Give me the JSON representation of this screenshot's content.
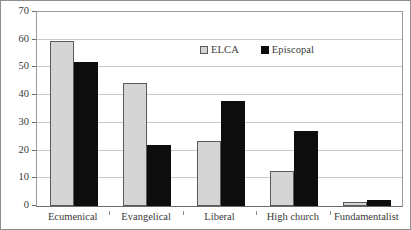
{
  "chart_data": {
    "type": "bar",
    "title": "",
    "subtitle": "",
    "xlabel": "",
    "ylabel": "",
    "categories": [
      "Ecumenical",
      "Evangelical",
      "Liberal",
      "High church",
      "Fundamentalist"
    ],
    "series": [
      {
        "name": "ELCA",
        "color": "#d5d5d5",
        "values": [
          59.5,
          44.5,
          23.5,
          12.5,
          1.5
        ]
      },
      {
        "name": "Episcopal",
        "color": "#0d0d0d",
        "values": [
          52,
          22,
          38,
          27,
          2
        ]
      }
    ],
    "ylim": [
      0,
      70
    ],
    "ytick_step": 10,
    "yticks": [
      0,
      10,
      20,
      30,
      40,
      50,
      60,
      70
    ],
    "ytick_labels": [
      "0",
      "10",
      "20",
      "30",
      "40",
      "50",
      "60",
      "70"
    ],
    "grid": "horizontal",
    "grid_color": "#c9c9c9",
    "legend_position": "inside-upper-center",
    "legend_border": false,
    "plot_border": true,
    "frame_border": true
  },
  "legend": {
    "entries": [
      {
        "label": "ELCA",
        "swatch": "legend-swatch-elca"
      },
      {
        "label": "Episcopal",
        "swatch": "legend-swatch-episcopal"
      }
    ]
  },
  "colors": {
    "series_elca": "#d5d5d5",
    "series_episcopal": "#0d0d0d",
    "gridline": "#c9c9c9",
    "axis": "#6b6b6b",
    "frame": "#8e8e8e",
    "text": "#3a3a3a",
    "background": "#ffffff"
  }
}
